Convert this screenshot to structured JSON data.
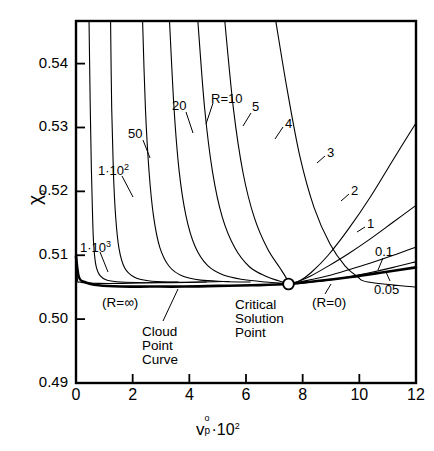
{
  "chart_data": {
    "type": "line",
    "title": "",
    "xlabel": "v_p^o · 10^2",
    "xlabel_parts": {
      "base": "v",
      "sup": "o",
      "sub": "p",
      "tail": "·10",
      "tail_sup": "2"
    },
    "ylabel": "χ₀",
    "ylabel_parts": {
      "base": "χ",
      "sub": "o"
    },
    "xlim": [
      0,
      12
    ],
    "ylim": [
      0.49,
      0.54667
    ],
    "xticks": [
      "0",
      "2",
      "4",
      "6",
      "8",
      "10",
      "12"
    ],
    "xtick_values": [
      0,
      2,
      4,
      6,
      8,
      10,
      12
    ],
    "yticks": [
      "0.54",
      "0.53",
      "0.52",
      "0.51",
      "0.50",
      "0.49"
    ],
    "ytick_values": [
      0.54,
      0.53,
      0.52,
      0.51,
      0.5,
      0.49
    ],
    "grid": false,
    "legend": "inline-curve-labels",
    "critical_point": {
      "x": 7.5,
      "y": 0.5055,
      "label": "Critical Solution Point",
      "marker": "open-circle"
    },
    "series": [
      {
        "name": "1·10³",
        "r_value": 1000,
        "points": [
          [
            0.02,
            0.51
          ],
          [
            0.05,
            0.5062
          ],
          [
            0.12,
            0.5058
          ],
          [
            0.3,
            0.5057
          ],
          [
            0.8,
            0.5056
          ],
          [
            1.6,
            0.5056
          ],
          [
            2.6,
            0.5057
          ],
          [
            3.6,
            0.5058
          ]
        ]
      },
      {
        "name": "1·10²",
        "r_value": 100,
        "points": [
          [
            0.46,
            0.5467
          ],
          [
            0.5,
            0.534
          ],
          [
            0.54,
            0.524
          ],
          [
            0.58,
            0.517
          ],
          [
            0.62,
            0.512
          ],
          [
            0.7,
            0.5085
          ],
          [
            0.85,
            0.5068
          ],
          [
            1.1,
            0.5061
          ],
          [
            1.6,
            0.5058
          ],
          [
            2.4,
            0.5057
          ],
          [
            3.4,
            0.5057
          ],
          [
            4.6,
            0.5058
          ]
        ]
      },
      {
        "name": "50",
        "r_value": 50,
        "points": [
          [
            1.22,
            0.5467
          ],
          [
            1.26,
            0.533
          ],
          [
            1.32,
            0.523
          ],
          [
            1.4,
            0.516
          ],
          [
            1.52,
            0.511
          ],
          [
            1.72,
            0.508
          ],
          [
            2.05,
            0.5066
          ],
          [
            2.55,
            0.506
          ],
          [
            3.3,
            0.5058
          ],
          [
            4.3,
            0.5058
          ],
          [
            5.4,
            0.5059
          ]
        ]
      },
      {
        "name": "20",
        "r_value": 20,
        "points": [
          [
            2.35,
            0.5467
          ],
          [
            2.45,
            0.533
          ],
          [
            2.58,
            0.523
          ],
          [
            2.74,
            0.516
          ],
          [
            2.96,
            0.5112
          ],
          [
            3.3,
            0.5082
          ],
          [
            3.78,
            0.5067
          ],
          [
            4.4,
            0.5061
          ],
          [
            5.2,
            0.5059
          ],
          [
            6.15,
            0.5058
          ]
        ]
      },
      {
        "name": "R=10",
        "r_value": 10,
        "points": [
          [
            3.3,
            0.5467
          ],
          [
            3.46,
            0.533
          ],
          [
            3.64,
            0.5232
          ],
          [
            3.88,
            0.5162
          ],
          [
            4.2,
            0.5114
          ],
          [
            4.64,
            0.5084
          ],
          [
            5.2,
            0.5069
          ],
          [
            5.9,
            0.5062
          ],
          [
            6.7,
            0.5058
          ],
          [
            7.3,
            0.5056
          ]
        ]
      },
      {
        "name": "5",
        "r_value": 5,
        "points": [
          [
            4.3,
            0.5467
          ],
          [
            4.54,
            0.533
          ],
          [
            4.82,
            0.523
          ],
          [
            5.16,
            0.516
          ],
          [
            5.6,
            0.5112
          ],
          [
            6.12,
            0.5082
          ],
          [
            6.7,
            0.5067
          ],
          [
            7.15,
            0.506
          ],
          [
            7.45,
            0.5056
          ]
        ]
      },
      {
        "name": "4",
        "r_value": 4,
        "points": [
          [
            5.25,
            0.5467
          ],
          [
            5.56,
            0.5328
          ],
          [
            5.9,
            0.5228
          ],
          [
            6.3,
            0.5158
          ],
          [
            6.76,
            0.511
          ],
          [
            7.2,
            0.508
          ],
          [
            7.44,
            0.5063
          ],
          [
            7.5,
            0.5056
          ]
        ]
      },
      {
        "name": "3",
        "r_value": 3,
        "points": [
          [
            7.05,
            0.5467
          ],
          [
            7.45,
            0.536
          ],
          [
            7.9,
            0.5255
          ],
          [
            8.4,
            0.5175
          ],
          [
            8.96,
            0.5118
          ],
          [
            9.5,
            0.5083
          ],
          [
            9.95,
            0.5066
          ],
          [
            10.3,
            0.5058
          ],
          [
            12.0,
            0.505
          ]
        ]
      },
      {
        "name": "2",
        "r_value": 2,
        "points": [
          [
            12.0,
            0.5307
          ],
          [
            11.2,
            0.525
          ],
          [
            10.4,
            0.5192
          ],
          [
            9.6,
            0.514
          ],
          [
            8.9,
            0.51
          ],
          [
            8.3,
            0.5073
          ],
          [
            7.9,
            0.506
          ],
          [
            7.56,
            0.5055
          ]
        ]
      },
      {
        "name": "1",
        "r_value": 1,
        "points": [
          [
            12.0,
            0.5178
          ],
          [
            11.2,
            0.5152
          ],
          [
            10.4,
            0.5126
          ],
          [
            9.6,
            0.5102
          ],
          [
            8.9,
            0.5083
          ],
          [
            8.3,
            0.5068
          ],
          [
            7.9,
            0.506
          ],
          [
            7.56,
            0.5055
          ]
        ]
      },
      {
        "name": "0.1",
        "r_value": 0.1,
        "points": [
          [
            12.0,
            0.5113
          ],
          [
            11.2,
            0.51
          ],
          [
            10.4,
            0.5088
          ],
          [
            9.6,
            0.5077
          ],
          [
            8.9,
            0.5068
          ],
          [
            8.3,
            0.5062
          ],
          [
            7.9,
            0.5058
          ],
          [
            7.56,
            0.5055
          ]
        ]
      },
      {
        "name": "0.05",
        "r_value": 0.05,
        "points": [
          [
            12.0,
            0.509
          ],
          [
            11.2,
            0.5081
          ],
          [
            10.4,
            0.5073
          ],
          [
            9.6,
            0.5066
          ],
          [
            8.9,
            0.5061
          ],
          [
            8.3,
            0.5058
          ],
          [
            7.9,
            0.5056
          ],
          [
            7.56,
            0.5055
          ]
        ]
      }
    ],
    "cloud_point_curve": {
      "name": "Cloud Point Curve",
      "emphasis": "thick",
      "points": [
        [
          0.0,
          0.5098
        ],
        [
          0.1,
          0.5066
        ],
        [
          0.3,
          0.5058
        ],
        [
          0.8,
          0.5053
        ],
        [
          1.6,
          0.5051
        ],
        [
          2.6,
          0.5051
        ],
        [
          3.8,
          0.5051
        ],
        [
          5.0,
          0.5052
        ],
        [
          6.2,
          0.5053
        ],
        [
          7.5,
          0.5055
        ],
        [
          8.6,
          0.506
        ],
        [
          9.7,
          0.5066
        ],
        [
          10.8,
          0.5073
        ],
        [
          12.0,
          0.5081
        ]
      ]
    },
    "curve_labels": [
      {
        "text": "1·10",
        "sup": "3",
        "x": 80,
        "y": 240,
        "leader": [
          [
            100,
            252
          ],
          [
            108,
            272
          ]
        ]
      },
      {
        "text": "1·10",
        "sup": "2",
        "x": 98,
        "y": 163,
        "leader": [
          [
            122,
            176
          ],
          [
            133,
            197
          ]
        ]
      },
      {
        "text": "50",
        "sup": "",
        "x": 128,
        "y": 127,
        "leader": [
          [
            143,
            140
          ],
          [
            150,
            158
          ]
        ]
      },
      {
        "text": "20",
        "sup": "",
        "x": 172,
        "y": 99,
        "leader": [
          [
            186,
            112
          ],
          [
            193,
            133
          ]
        ]
      },
      {
        "text": "R=10",
        "sup": "",
        "x": 211,
        "y": 92,
        "leader": [
          [
            213,
            103
          ],
          [
            206,
            124
          ]
        ]
      },
      {
        "text": "5",
        "sup": "",
        "x": 252,
        "y": 100,
        "leader": [
          [
            251,
            113
          ],
          [
            243,
            126
          ]
        ]
      },
      {
        "text": "4",
        "sup": "",
        "x": 285,
        "y": 117,
        "leader": [
          [
            283,
            127
          ],
          [
            275,
            139
          ]
        ]
      },
      {
        "text": "3",
        "sup": "",
        "x": 327,
        "y": 146,
        "leader": [
          [
            325,
            156
          ],
          [
            317,
            163
          ]
        ]
      },
      {
        "text": "2",
        "sup": "",
        "x": 351,
        "y": 184,
        "leader": [
          [
            349,
            194
          ],
          [
            341,
            201
          ]
        ]
      },
      {
        "text": "1",
        "sup": "",
        "x": 367,
        "y": 217,
        "leader": [
          [
            365,
            227
          ],
          [
            357,
            232
          ]
        ]
      },
      {
        "text": "0.1",
        "sup": "",
        "x": 375,
        "y": 245,
        "leader": [
          [
            383,
            258
          ],
          [
            378,
            270
          ]
        ]
      },
      {
        "text": "0.05",
        "sup": "",
        "x": 374,
        "y": 283,
        "leader": [
          [
            390,
            281
          ],
          [
            386,
            272
          ]
        ]
      }
    ],
    "annotations": [
      {
        "text": "(R=∞)",
        "x": 102,
        "y": 296
      },
      {
        "text": "(R=0)",
        "x": 312,
        "y": 296,
        "leader": [
          [
            325,
            294
          ],
          [
            331,
            284
          ]
        ]
      },
      {
        "text": "Cloud",
        "x": 142,
        "y": 325,
        "leader": [
          [
            163,
            321
          ],
          [
            178,
            289
          ]
        ]
      },
      {
        "text": "Point",
        "x": 142,
        "y": 339
      },
      {
        "text": "Curve",
        "x": 142,
        "y": 353
      },
      {
        "text": "Critical",
        "x": 235,
        "y": 298
      },
      {
        "text": "Solution",
        "x": 235,
        "y": 312
      },
      {
        "text": "Point",
        "x": 235,
        "y": 326
      }
    ]
  },
  "style": {
    "frame_color": "#000000",
    "curve_color": "#000000",
    "cloud_curve_color": "#000000",
    "background": "#ffffff"
  }
}
